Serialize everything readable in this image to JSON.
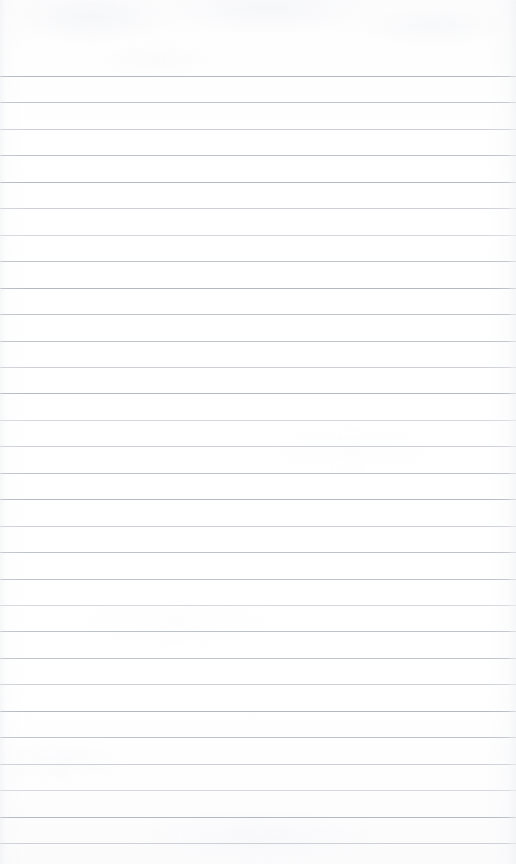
{
  "document": {
    "kind": "scanned-ruled-notebook-page",
    "title": "Blank Ruled Notebook Page",
    "page_width": 516,
    "page_height": 864,
    "written_text": "",
    "is_blank": true
  },
  "paper": {
    "background_color": "#ffffff",
    "tone_color": "#fcfcfd",
    "edge_shade_color": "#e2e4e9"
  },
  "ruling": {
    "line_color": "#b9bdc5",
    "line_thickness_px": 1,
    "line_spacing_px": 26.45,
    "first_line_y": 76,
    "last_line_y": 843,
    "line_count": 30,
    "line_start_x": 1,
    "line_end_x": 509,
    "top_margin_px": 76,
    "bottom_margin_px": 21,
    "left_margin_px": 1,
    "right_margin_px": 7,
    "has_vertical_margin_rule": false,
    "has_holes": false,
    "has_header": false,
    "has_page_number": false
  }
}
